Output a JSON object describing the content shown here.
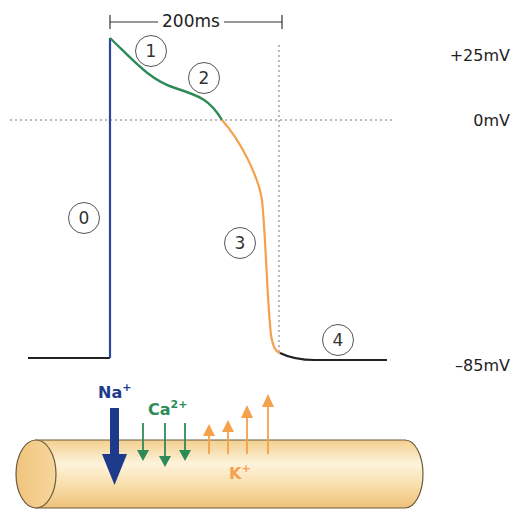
{
  "diagram": {
    "scale_bar": {
      "label": "200ms"
    },
    "voltage_labels": {
      "peak": "+25mV",
      "zero": "0mV",
      "rest": "–85mV"
    },
    "phases": [
      {
        "id": "0",
        "label": "0",
        "color": "#2a4aa0",
        "description": "rapid depolarization"
      },
      {
        "id": "1",
        "label": "1",
        "color": "#2e8b57",
        "description": "early repolarization"
      },
      {
        "id": "2",
        "label": "2",
        "color": "#2e8b57",
        "description": "plateau"
      },
      {
        "id": "3",
        "label": "3",
        "color": "#f5a04a",
        "description": "repolarization"
      },
      {
        "id": "4",
        "label": "4",
        "color": "#222222",
        "description": "resting potential"
      }
    ],
    "ions": {
      "sodium": {
        "symbol": "Na",
        "charge": "+",
        "color": "#1e3a8a",
        "direction": "inward"
      },
      "calcium": {
        "symbol": "Ca",
        "charge": "2+",
        "color": "#2e8b57",
        "direction": "inward"
      },
      "potassium": {
        "symbol": "K",
        "charge": "+",
        "color": "#f5a04a",
        "direction": "outward"
      }
    },
    "cell": {
      "fill": "#fbe3b0",
      "stroke": "#6b5a3a"
    }
  }
}
